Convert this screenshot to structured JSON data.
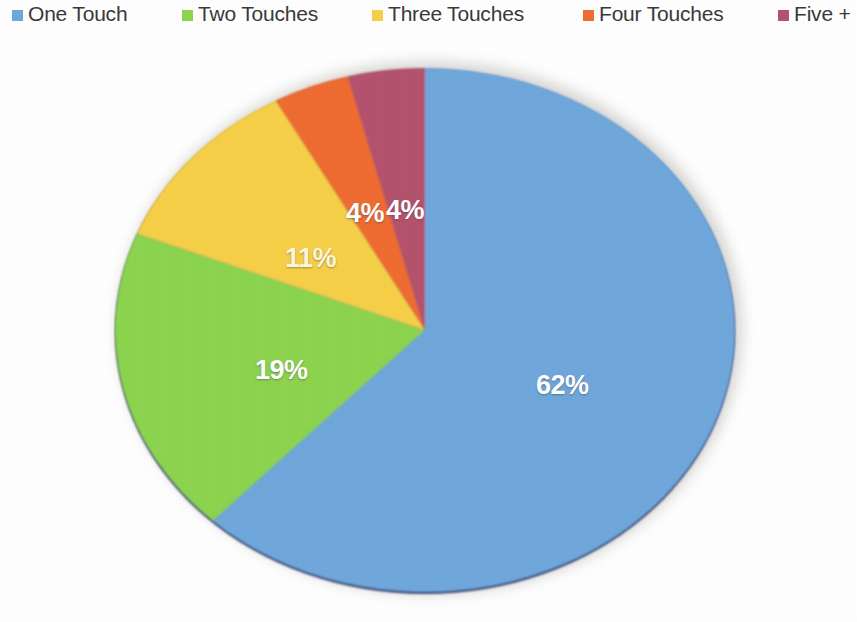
{
  "legend": {
    "position": "top",
    "items": [
      {
        "label": "One Touch",
        "color": "#6fa8dc",
        "icon": "legend-swatch-icon",
        "x": 12
      },
      {
        "label": "Two Touches",
        "color": "#8dd44f",
        "icon": "legend-swatch-icon",
        "x": 182
      },
      {
        "label": "Three Touches",
        "color": "#f7d04a",
        "icon": "legend-swatch-icon",
        "x": 372
      },
      {
        "label": "Four Touches",
        "color": "#ef6c33",
        "icon": "legend-swatch-icon",
        "x": 583
      },
      {
        "label": "Five +",
        "color": "#b5536e",
        "icon": "legend-swatch-icon",
        "x": 778
      }
    ]
  },
  "chart_data": {
    "type": "pie",
    "title": "",
    "subtitle": "",
    "xlabel": "",
    "ylabel": "",
    "grid": false,
    "legend_position": "top",
    "style": "3d",
    "start_angle_deg": 0,
    "direction": "clockwise",
    "categories": [
      "One Touch",
      "Two Touches",
      "Three Touches",
      "Four Touches",
      "Five +"
    ],
    "values": [
      62,
      19,
      11,
      4,
      4
    ],
    "value_unit": "%",
    "colors": [
      "#6fa8dc",
      "#8dd44f",
      "#f7d04a",
      "#ef6c33",
      "#b5536e"
    ],
    "side_colors": [
      "#3d4f7d",
      "#5f9138",
      "#b89338",
      "#b04d22",
      "#7d3a4c"
    ],
    "data_labels": [
      "62%",
      "19%",
      "11%",
      "4%",
      "4%"
    ],
    "data_label_color": "#ffffff",
    "depth_px": 20,
    "base_color": "#3f4b79",
    "shadow_color": "#b9b7b3"
  },
  "labels": {
    "one_touch_pct": "62%",
    "two_touches_pct": "19%",
    "three_touches_pct": "11%",
    "four_touches_pct": "4%",
    "five_plus_pct": "4%"
  }
}
